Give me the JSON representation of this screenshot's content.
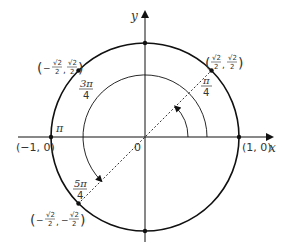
{
  "diagram": {
    "axes": {
      "x_label": "x",
      "y_label": "y",
      "origin_label": "0"
    },
    "points": [
      {
        "id": "p0",
        "coord_label": "(1, 0)"
      },
      {
        "id": "p_pi",
        "coord_label": "(−1, 0)",
        "angle_label": "π"
      },
      {
        "id": "p_pi4",
        "x_num": "√2",
        "x_den": "2",
        "y_num": "√2",
        "y_den": "2",
        "x_sign": "",
        "y_sign": "",
        "angle_num": "π",
        "angle_den": "4"
      },
      {
        "id": "p_3pi4",
        "x_num": "√2",
        "x_den": "2",
        "y_num": "√2",
        "y_den": "2",
        "x_sign": "−",
        "y_sign": "",
        "angle_num": "3π",
        "angle_den": "4"
      },
      {
        "id": "p_5pi4",
        "x_num": "√2",
        "x_den": "2",
        "y_num": "√2",
        "y_den": "2",
        "x_sign": "−",
        "y_sign": "−",
        "angle_num": "5π",
        "angle_den": "4"
      }
    ],
    "colors": {
      "stroke": "#111111",
      "text": "#333333"
    }
  }
}
